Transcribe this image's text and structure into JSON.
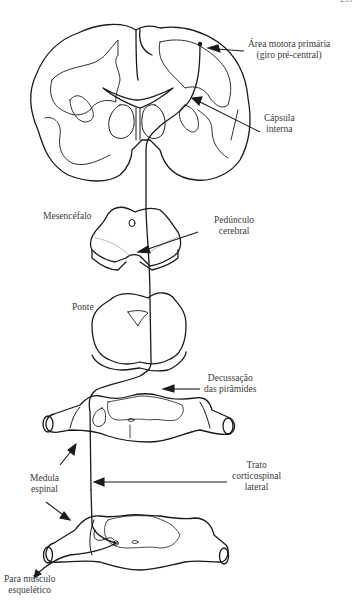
{
  "diagram": {
    "type": "corticospinal-tract-pathway",
    "page_number": "233",
    "labels": {
      "area_motora_1": "Área motora primária",
      "area_motora_2": "(giro pré-central)",
      "capsula_1": "Cápsula",
      "capsula_2": "interna",
      "mesencefalo": "Mesencéfalo",
      "peduncolo_1": "Pedúnculo",
      "peduncolo_2": "cerebral",
      "ponte": "Ponte",
      "decussacao_1": "Decussação",
      "decussacao_2": "das pirâmides",
      "trato_1": "Trato",
      "trato_2": "corticospinal",
      "trato_3": "lateral",
      "medula_1": "Medula",
      "medula_2": "espinal",
      "para_1": "Para músculo",
      "para_2": "esquelético"
    },
    "structures": [
      "brain-coronal-section",
      "midbrain",
      "pons",
      "upper-spinal-cord",
      "lower-spinal-cord"
    ],
    "line_color": "#1a1a1a"
  }
}
